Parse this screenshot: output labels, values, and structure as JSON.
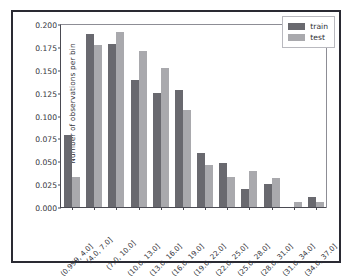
{
  "chart_data": {
    "type": "bar",
    "title": "",
    "xlabel": "",
    "ylabel": "Number of observations per bin",
    "ylim": [
      0.0,
      0.2
    ],
    "yticks": [
      "0.000",
      "0.025",
      "0.050",
      "0.075",
      "0.100",
      "0.125",
      "0.150",
      "0.175",
      "0.200"
    ],
    "ytick_values": [
      0.0,
      0.025,
      0.05,
      0.075,
      0.1,
      0.125,
      0.15,
      0.175,
      0.2
    ],
    "grid": false,
    "legend_position": "upper right",
    "categories": [
      "(0.999, 4.0]",
      "(4.0, 7.0]",
      "(7.0, 10.0]",
      "(10.0, 13.0]",
      "(13.0, 16.0]",
      "(16.0, 19.0]",
      "(19.0, 22.0]",
      "(22.0, 25.0]",
      "(25.0, 28.0]",
      "(28.0, 31.0]",
      "(31.0, 34.0]",
      "(34.0, 37.0]"
    ],
    "series": [
      {
        "name": "train",
        "color": "#69696f",
        "values": [
          0.079,
          0.189,
          0.178,
          0.139,
          0.125,
          0.128,
          0.059,
          0.048,
          0.02,
          0.025,
          0.0,
          0.011
        ]
      },
      {
        "name": "test",
        "color": "#a9a9ad",
        "values": [
          0.033,
          0.177,
          0.191,
          0.171,
          0.152,
          0.106,
          0.046,
          0.033,
          0.039,
          0.032,
          0.006,
          0.006
        ]
      }
    ]
  },
  "legend": {
    "entries": [
      {
        "label": "train"
      },
      {
        "label": "test"
      }
    ]
  }
}
